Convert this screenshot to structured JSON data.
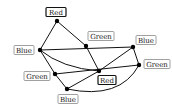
{
  "diagram": {
    "type": "graph-coloring",
    "nodes": [
      {
        "id": "n1",
        "label": "Red",
        "x": 57,
        "y": 21,
        "lx": 56,
        "ly": 12,
        "lw": 20,
        "border": "red"
      },
      {
        "id": "n2",
        "label": "Blue",
        "x": 40,
        "y": 50,
        "lx": 24,
        "ly": 50,
        "lw": 20,
        "border": "gray"
      },
      {
        "id": "n3",
        "label": "Green",
        "x": 86,
        "y": 46,
        "lx": 101,
        "ly": 36,
        "lw": 26,
        "border": "gray"
      },
      {
        "id": "n4",
        "label": "Blue",
        "x": 133,
        "y": 47,
        "lx": 146,
        "ly": 40,
        "lw": 20,
        "border": "gray"
      },
      {
        "id": "n5",
        "label": "Green",
        "x": 139,
        "y": 65,
        "lx": 157,
        "ly": 64,
        "lw": 26,
        "border": "gray"
      },
      {
        "id": "n6",
        "label": "Red",
        "x": 99,
        "y": 71,
        "lx": 107,
        "ly": 80,
        "lw": 18,
        "border": "red"
      },
      {
        "id": "n7",
        "label": "Green",
        "x": 55,
        "y": 74,
        "lx": 37,
        "ly": 76,
        "lw": 26,
        "border": "gray"
      },
      {
        "id": "n8",
        "label": "Blue",
        "x": 67,
        "y": 89,
        "lx": 68,
        "ly": 99,
        "lw": 20,
        "border": "gray"
      }
    ],
    "edges": [
      {
        "from": "n1",
        "to": "n2"
      },
      {
        "from": "n1",
        "to": "n3"
      },
      {
        "from": "n2",
        "to": "n4"
      },
      {
        "from": "n2",
        "to": "n6",
        "curve": true
      },
      {
        "from": "n2",
        "to": "n7"
      },
      {
        "from": "n3",
        "to": "n6"
      },
      {
        "from": "n4",
        "to": "n6"
      },
      {
        "from": "n4",
        "to": "n5"
      },
      {
        "from": "n7",
        "to": "n5"
      },
      {
        "from": "n7",
        "to": "n8"
      },
      {
        "from": "n8",
        "to": "n6"
      },
      {
        "from": "n8",
        "to": "n5",
        "curve": true
      }
    ]
  }
}
